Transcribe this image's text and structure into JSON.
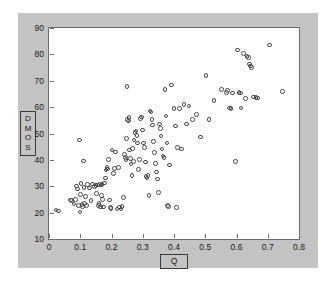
{
  "figure": {
    "background_color": "#c3c3c3",
    "plot_background_color": "#ffffff",
    "axis_color": "#6b6b6b",
    "marker_color": "#4a4a4a",
    "ylabel_letters": [
      "D",
      "M",
      "O",
      "S"
    ],
    "xlabel_text": "Q"
  },
  "chart_data": {
    "type": "scatter",
    "title": "",
    "xlabel": "Q",
    "ylabel": "DMOS",
    "xlim": [
      0,
      0.8
    ],
    "ylim": [
      10,
      90
    ],
    "xticks": [
      0,
      0.1,
      0.2,
      0.3,
      0.4,
      0.5,
      0.6,
      0.7,
      0.8
    ],
    "xticklabels": [
      "0",
      "0.1",
      "0.2",
      "0.3",
      "0.4",
      "0.5",
      "0.6",
      "0.7",
      "0.8"
    ],
    "yticks": [
      10,
      20,
      30,
      40,
      50,
      60,
      70,
      80,
      90
    ],
    "yticklabels": [
      "10",
      "20",
      "30",
      "40",
      "50",
      "60",
      "70",
      "80",
      "90"
    ],
    "grid": false,
    "legend": null,
    "marker": "open-circle",
    "series": [
      {
        "name": "DMOS vs Q",
        "points": [
          [
            0.022,
            21.0
          ],
          [
            0.03,
            20.6
          ],
          [
            0.068,
            24.8
          ],
          [
            0.072,
            24.6
          ],
          [
            0.08,
            23.2
          ],
          [
            0.085,
            25.0
          ],
          [
            0.088,
            30.1
          ],
          [
            0.092,
            29.0
          ],
          [
            0.094,
            22.6
          ],
          [
            0.097,
            47.6
          ],
          [
            0.099,
            20.2
          ],
          [
            0.101,
            26.8
          ],
          [
            0.103,
            31.0
          ],
          [
            0.105,
            23.0
          ],
          [
            0.107,
            22.4
          ],
          [
            0.11,
            39.5
          ],
          [
            0.112,
            29.6
          ],
          [
            0.114,
            23.4
          ],
          [
            0.117,
            26.2
          ],
          [
            0.12,
            22.8
          ],
          [
            0.124,
            30.6
          ],
          [
            0.129,
            29.4
          ],
          [
            0.134,
            24.6
          ],
          [
            0.14,
            30.8
          ],
          [
            0.145,
            29.8
          ],
          [
            0.15,
            30.2
          ],
          [
            0.152,
            27.3
          ],
          [
            0.156,
            30.4
          ],
          [
            0.158,
            22.6
          ],
          [
            0.16,
            23.4
          ],
          [
            0.162,
            30.6
          ],
          [
            0.164,
            22.1
          ],
          [
            0.166,
            30.4
          ],
          [
            0.168,
            26.4
          ],
          [
            0.17,
            30.7
          ],
          [
            0.172,
            25.0
          ],
          [
            0.175,
            22.2
          ],
          [
            0.178,
            31.2
          ],
          [
            0.18,
            33.2
          ],
          [
            0.183,
            36.2
          ],
          [
            0.186,
            37.0
          ],
          [
            0.188,
            36.6
          ],
          [
            0.19,
            40.2
          ],
          [
            0.193,
            24.8
          ],
          [
            0.196,
            22.0
          ],
          [
            0.199,
            21.6
          ],
          [
            0.202,
            43.8
          ],
          [
            0.206,
            34.8
          ],
          [
            0.21,
            36.8
          ],
          [
            0.213,
            43.0
          ],
          [
            0.217,
            21.4
          ],
          [
            0.222,
            37.2
          ],
          [
            0.226,
            22.1
          ],
          [
            0.23,
            21.3
          ],
          [
            0.234,
            22.4
          ],
          [
            0.238,
            25.8
          ],
          [
            0.241,
            42.0
          ],
          [
            0.244,
            41.0
          ],
          [
            0.246,
            40.2
          ],
          [
            0.248,
            48.0
          ],
          [
            0.25,
            67.8
          ],
          [
            0.252,
            55.4
          ],
          [
            0.254,
            54.8
          ],
          [
            0.256,
            56.0
          ],
          [
            0.258,
            43.8
          ],
          [
            0.26,
            40.6
          ],
          [
            0.262,
            38.4
          ],
          [
            0.265,
            34.0
          ],
          [
            0.268,
            44.4
          ],
          [
            0.27,
            39.4
          ],
          [
            0.272,
            47.6
          ],
          [
            0.275,
            50.4
          ],
          [
            0.278,
            51.0
          ],
          [
            0.281,
            49.2
          ],
          [
            0.284,
            46.4
          ],
          [
            0.287,
            36.4
          ],
          [
            0.29,
            40.2
          ],
          [
            0.293,
            55.6
          ],
          [
            0.296,
            56.2
          ],
          [
            0.299,
            51.4
          ],
          [
            0.302,
            46.4
          ],
          [
            0.305,
            44.6
          ],
          [
            0.308,
            39.2
          ],
          [
            0.311,
            33.6
          ],
          [
            0.314,
            33.2
          ],
          [
            0.317,
            34.0
          ],
          [
            0.32,
            26.4
          ],
          [
            0.323,
            58.6
          ],
          [
            0.326,
            58.2
          ],
          [
            0.329,
            55.4
          ],
          [
            0.332,
            53.2
          ],
          [
            0.335,
            47.0
          ],
          [
            0.338,
            42.8
          ],
          [
            0.341,
            38.6
          ],
          [
            0.344,
            35.4
          ],
          [
            0.347,
            32.8
          ],
          [
            0.35,
            27.6
          ],
          [
            0.353,
            53.6
          ],
          [
            0.356,
            51.8
          ],
          [
            0.359,
            49.0
          ],
          [
            0.362,
            44.2
          ],
          [
            0.365,
            41.4
          ],
          [
            0.368,
            41.0
          ],
          [
            0.371,
            66.6
          ],
          [
            0.374,
            56.6
          ],
          [
            0.377,
            46.4
          ],
          [
            0.38,
            22.6
          ],
          [
            0.383,
            22.4
          ],
          [
            0.386,
            38.0
          ],
          [
            0.392,
            68.4
          ],
          [
            0.4,
            59.4
          ],
          [
            0.404,
            52.8
          ],
          [
            0.408,
            22.0
          ],
          [
            0.412,
            44.8
          ],
          [
            0.418,
            59.4
          ],
          [
            0.424,
            44.2
          ],
          [
            0.432,
            61.0
          ],
          [
            0.44,
            53.6
          ],
          [
            0.448,
            60.4
          ],
          [
            0.46,
            55.4
          ],
          [
            0.472,
            57.2
          ],
          [
            0.485,
            48.6
          ],
          [
            0.503,
            72.0
          ],
          [
            0.512,
            55.4
          ],
          [
            0.528,
            62.6
          ],
          [
            0.552,
            66.6
          ],
          [
            0.568,
            65.6
          ],
          [
            0.572,
            66.2
          ],
          [
            0.578,
            59.6
          ],
          [
            0.582,
            59.4
          ],
          [
            0.588,
            65.4
          ],
          [
            0.596,
            39.4
          ],
          [
            0.604,
            81.6
          ],
          [
            0.608,
            65.6
          ],
          [
            0.612,
            65.4
          ],
          [
            0.615,
            59.6
          ],
          [
            0.622,
            80.4
          ],
          [
            0.628,
            63.2
          ],
          [
            0.634,
            79.2
          ],
          [
            0.638,
            78.8
          ],
          [
            0.642,
            76.4
          ],
          [
            0.645,
            75.6
          ],
          [
            0.648,
            75.0
          ],
          [
            0.655,
            63.8
          ],
          [
            0.662,
            63.6
          ],
          [
            0.668,
            63.4
          ],
          [
            0.706,
            83.6
          ],
          [
            0.748,
            66.0
          ]
        ]
      }
    ]
  }
}
